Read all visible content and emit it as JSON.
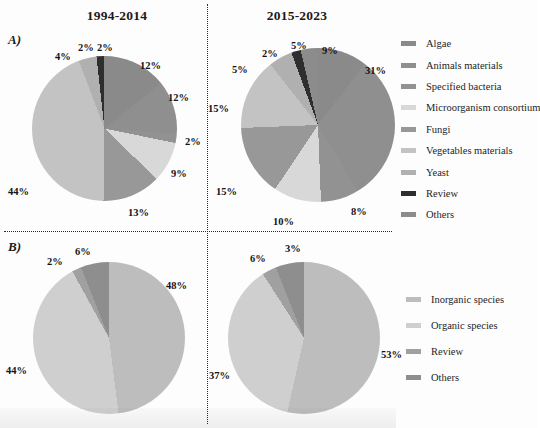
{
  "figure": {
    "panels": [
      {
        "id": "A",
        "label": "A)"
      },
      {
        "id": "B",
        "label": "B)"
      }
    ],
    "column_titles": [
      "1994-2014",
      "2015-2023"
    ]
  },
  "legends": {
    "top": {
      "name": "substrate-legend",
      "items": [
        {
          "label": "Algae",
          "color": "#8a8a8a"
        },
        {
          "label": "Animals materials",
          "color": "#8f8f8f"
        },
        {
          "label": "Specified bacteria",
          "color": "#929292"
        },
        {
          "label": "Microorganism consortium",
          "color": "#d8d8d8"
        },
        {
          "label": "Fungi",
          "color": "#989898"
        },
        {
          "label": "Vegetables materials",
          "color": "#c3c3c3"
        },
        {
          "label": "Yeast",
          "color": "#b0b0b0"
        },
        {
          "label": "Review",
          "color": "#2e2e2e"
        },
        {
          "label": "Others",
          "color": "#8c8c8c"
        }
      ]
    },
    "bottom": {
      "name": "species-legend",
      "items": [
        {
          "label": "Inorganic species",
          "color": "#bdbdbd"
        },
        {
          "label": "Organic species",
          "color": "#cfcfcf"
        },
        {
          "label": "Review",
          "color": "#a0a0a0"
        },
        {
          "label": "Others",
          "color": "#8e8e8e"
        }
      ]
    }
  },
  "chart_data": [
    {
      "type": "pie",
      "name": "panel-a-1994-2014",
      "title": "1994-2014",
      "panel": "A)",
      "legend_position": "right",
      "categories": [
        "Algae",
        "Animals materials",
        "Specified bacteria",
        "Microorganism consortium",
        "Fungi",
        "Vegetables materials",
        "Yeast",
        "Review",
        "Others"
      ],
      "values": [
        12,
        12,
        2,
        9,
        13,
        44,
        4,
        2,
        2
      ],
      "labels": [
        "12%",
        "12%",
        "2%",
        "9%",
        "13%",
        "44%",
        "4%",
        "2%",
        "2%"
      ],
      "units": "percent"
    },
    {
      "type": "pie",
      "name": "panel-a-2015-2023",
      "title": "2015-2023",
      "panel": "A)",
      "legend_position": "right",
      "categories": [
        "Algae",
        "Animals materials",
        "Specified bacteria",
        "Microorganism consortium",
        "Fungi",
        "Vegetables materials",
        "Yeast",
        "Review",
        "Others"
      ],
      "values": [
        9,
        31,
        8,
        10,
        15,
        15,
        5,
        2,
        5
      ],
      "labels": [
        "9%",
        "31%",
        "8%",
        "10%",
        "15%",
        "15%",
        "5%",
        "2%",
        "5%"
      ],
      "units": "percent"
    },
    {
      "type": "pie",
      "name": "panel-b-1994-2014",
      "title": "1994-2014",
      "panel": "B)",
      "legend_position": "right",
      "categories": [
        "Inorganic species",
        "Organic species",
        "Review",
        "Others"
      ],
      "values": [
        48,
        44,
        2,
        6
      ],
      "labels": [
        "48%",
        "44%",
        "2%",
        "6%"
      ],
      "units": "percent"
    },
    {
      "type": "pie",
      "name": "panel-b-2015-2023",
      "title": "2015-2023",
      "panel": "B)",
      "legend_position": "right",
      "categories": [
        "Inorganic species",
        "Organic species",
        "Review",
        "Others"
      ],
      "values": [
        53,
        37,
        3,
        6
      ],
      "labels": [
        "53%",
        "37%",
        "3%",
        "6%"
      ],
      "units": "percent"
    }
  ],
  "pct_labels": {
    "a1": [
      {
        "text": "2%",
        "left": 78,
        "top": 42
      },
      {
        "text": "2%",
        "left": 97,
        "top": 42
      },
      {
        "text": "12%",
        "left": 140,
        "top": 60
      },
      {
        "text": "12%",
        "left": 168,
        "top": 92
      },
      {
        "text": "2%",
        "left": 185,
        "top": 136
      },
      {
        "text": "9%",
        "left": 171,
        "top": 168
      },
      {
        "text": "13%",
        "left": 128,
        "top": 207
      },
      {
        "text": "44%",
        "left": 8,
        "top": 186
      },
      {
        "text": "4%",
        "left": 55,
        "top": 51
      }
    ],
    "a2": [
      {
        "text": "5%",
        "left": 291,
        "top": 40
      },
      {
        "text": "9%",
        "left": 322,
        "top": 45
      },
      {
        "text": "31%",
        "left": 365,
        "top": 65
      },
      {
        "text": "8%",
        "left": 351,
        "top": 206
      },
      {
        "text": "10%",
        "left": 273,
        "top": 216
      },
      {
        "text": "15%",
        "left": 216,
        "top": 186
      },
      {
        "text": "15%",
        "left": 208,
        "top": 103
      },
      {
        "text": "5%",
        "left": 232,
        "top": 64
      },
      {
        "text": "2%",
        "left": 262,
        "top": 48
      }
    ],
    "b1": [
      {
        "text": "6%",
        "left": 75,
        "top": 246
      },
      {
        "text": "2%",
        "left": 47,
        "top": 256
      },
      {
        "text": "48%",
        "left": 166,
        "top": 280
      },
      {
        "text": "44%",
        "left": 6,
        "top": 365
      }
    ],
    "b2": [
      {
        "text": "3%",
        "left": 285,
        "top": 243
      },
      {
        "text": "6%",
        "left": 250,
        "top": 253
      },
      {
        "text": "53%",
        "left": 381,
        "top": 349
      },
      {
        "text": "37%",
        "left": 209,
        "top": 370
      }
    ]
  }
}
